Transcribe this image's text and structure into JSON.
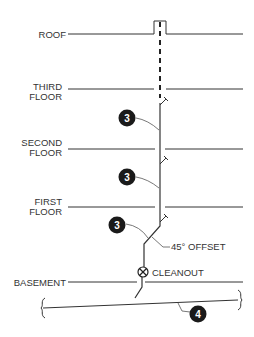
{
  "diagram": {
    "floors": [
      {
        "id": "roof",
        "label_lines": [
          "ROOF"
        ],
        "y": 34
      },
      {
        "id": "third",
        "label_lines": [
          "THIRD",
          "FLOOR"
        ],
        "y": 89
      },
      {
        "id": "second",
        "label_lines": [
          "SECOND",
          "FLOOR"
        ],
        "y": 149
      },
      {
        "id": "first",
        "label_lines": [
          "FIRST",
          "FLOOR"
        ],
        "y": 207
      },
      {
        "id": "basement",
        "label_lines": [
          "BASEMENT"
        ],
        "y": 282
      }
    ],
    "callouts": [
      {
        "id": "callout-3-upper",
        "number": "3"
      },
      {
        "id": "callout-3-middle",
        "number": "3"
      },
      {
        "id": "callout-3-lower",
        "number": "3"
      },
      {
        "id": "callout-4",
        "number": "4"
      }
    ],
    "annotations": {
      "offset": "45° OFFSET",
      "cleanout": "CLEANOUT"
    },
    "colors": {
      "line": "#333333",
      "badge": "#1a1a1a",
      "badge_text": "#ffffff"
    }
  }
}
